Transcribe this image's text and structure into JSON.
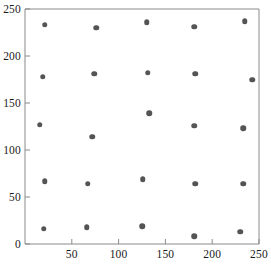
{
  "chart_data": {
    "type": "scatter",
    "title": "",
    "subtitle": "",
    "xlabel": "",
    "ylabel": "",
    "xlim": [
      0,
      250
    ],
    "ylim": [
      0,
      250
    ],
    "grid": false,
    "legend": null,
    "xticks": [
      50,
      100,
      150,
      200,
      250
    ],
    "xtick_labels": [
      "50",
      "100",
      "150",
      "200",
      "250"
    ],
    "yticks": [
      0,
      50,
      100,
      150,
      200,
      250
    ],
    "ytick_labels": [
      "0",
      "50",
      "100",
      "150",
      "200",
      "250"
    ],
    "marker": "circle",
    "marker_color": "#545454",
    "marker_size_px": 5.5,
    "n_points": 25,
    "points": [
      {
        "x": 21,
        "y": 233
      },
      {
        "x": 76,
        "y": 230
      },
      {
        "x": 130,
        "y": 236
      },
      {
        "x": 181,
        "y": 231
      },
      {
        "x": 235,
        "y": 237
      },
      {
        "x": 19,
        "y": 178
      },
      {
        "x": 74,
        "y": 181
      },
      {
        "x": 131,
        "y": 182
      },
      {
        "x": 182,
        "y": 181
      },
      {
        "x": 243,
        "y": 175
      },
      {
        "x": 16,
        "y": 127
      },
      {
        "x": 72,
        "y": 114
      },
      {
        "x": 133,
        "y": 139
      },
      {
        "x": 181,
        "y": 126
      },
      {
        "x": 233,
        "y": 123
      },
      {
        "x": 21,
        "y": 67
      },
      {
        "x": 67,
        "y": 64
      },
      {
        "x": 126,
        "y": 69
      },
      {
        "x": 182,
        "y": 64
      },
      {
        "x": 233,
        "y": 64
      },
      {
        "x": 20,
        "y": 16
      },
      {
        "x": 66,
        "y": 18
      },
      {
        "x": 125,
        "y": 19
      },
      {
        "x": 181,
        "y": 8
      },
      {
        "x": 230,
        "y": 13
      }
    ]
  },
  "axes": {
    "frame_color": "#8a8a8a",
    "tick_color": "#8a8a8a",
    "label_color": "#1a1a1a"
  }
}
